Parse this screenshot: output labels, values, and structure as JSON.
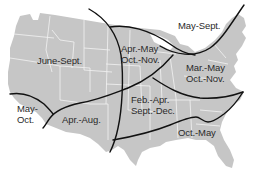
{
  "map": {
    "subject": "United States (contiguous)",
    "colors": {
      "background": "#ffffff",
      "land": "#c6c6c6",
      "state_borders": "#f2f2f2",
      "boundary_lines": "#111111",
      "label_text": "#2a2a2a"
    },
    "regions": [
      {
        "id": "northwest",
        "lines": [
          "June-Sept."
        ]
      },
      {
        "id": "north-central",
        "lines": [
          "Apr.-May",
          "Oct.-Nov."
        ]
      },
      {
        "id": "northeast-north",
        "lines": [
          "May-Sept."
        ]
      },
      {
        "id": "northeast-mid",
        "lines": [
          "Mar.-May",
          "Oct.-Nov."
        ]
      },
      {
        "id": "california-coast",
        "lines": [
          "May-",
          "Oct."
        ]
      },
      {
        "id": "southwest",
        "lines": [
          "Apr.-Aug."
        ]
      },
      {
        "id": "south-central",
        "lines": [
          "Feb.-Apr.",
          "Sept.-Dec."
        ]
      },
      {
        "id": "southeast",
        "lines": [
          "Oct.-May"
        ]
      }
    ]
  }
}
